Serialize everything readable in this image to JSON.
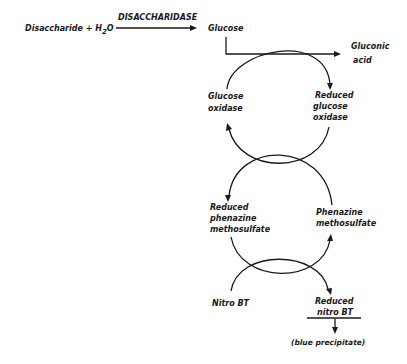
{
  "diagram": {
    "title": "",
    "reaction": {
      "substrate": "Disaccharide + H",
      "water_sub": "2",
      "water_o": "O",
      "enzyme": "DISACCHARIDASE",
      "product": "Glucose"
    },
    "cycle1": {
      "product": [
        "Gluconic",
        "acid"
      ],
      "left_label": [
        "Glucose",
        "oxidase"
      ],
      "right_label": [
        "Reduced",
        "glucose",
        "oxidase"
      ]
    },
    "cycle2": {
      "left_label": [
        "Reduced",
        "phenazine",
        "methosulfate"
      ],
      "right_label": [
        "Phenazine",
        "methosulfate"
      ]
    },
    "cycle3": {
      "left_label": [
        "Nitro BT"
      ],
      "right_label": [
        "Reduced",
        "nitro BT"
      ],
      "final_product": "(blue precipitate)"
    },
    "colors": {
      "ink": "#1a1a1a",
      "background": "#ffffff"
    }
  }
}
